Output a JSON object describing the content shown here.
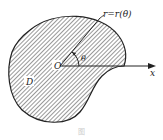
{
  "figure": {
    "curve_label": "r=r(θ)",
    "region_label": "D",
    "origin_label": "O",
    "angle_label": "θ",
    "axis_label": "x",
    "caption": "图"
  },
  "colors": {
    "stroke": "#222222",
    "hatch": "#333333",
    "background": "#ffffff"
  }
}
